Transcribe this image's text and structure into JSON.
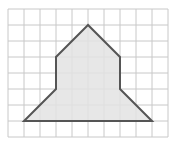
{
  "diagram": {
    "type": "polygon-on-grid",
    "grid": {
      "origin_x": 8,
      "origin_y": 9,
      "cell_size": 16,
      "columns": 10,
      "rows": 8,
      "line_color": "#c8c8c8"
    },
    "shape": {
      "vertices_grid": [
        [
          5,
          1
        ],
        [
          3,
          3
        ],
        [
          3,
          5
        ],
        [
          1,
          7
        ],
        [
          9,
          7
        ],
        [
          7,
          5
        ],
        [
          7,
          3
        ]
      ],
      "fill_color": "#e3e3e3",
      "stroke_color": "#555555",
      "stroke_width": 2
    }
  }
}
